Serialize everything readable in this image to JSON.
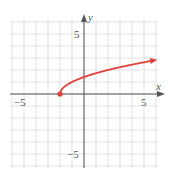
{
  "chart_data": {
    "type": "line",
    "title": "",
    "function": "y = sqrt(x + 2)",
    "xlabel": "x",
    "ylabel": "y",
    "xlim": [
      -6,
      6
    ],
    "ylim": [
      -6,
      6
    ],
    "grid": true,
    "tick_labels": {
      "x": [
        {
          "value": -5,
          "label": "−5"
        },
        {
          "value": 5,
          "label": "5"
        }
      ],
      "y": [
        {
          "value": 5,
          "label": "5"
        },
        {
          "value": -5,
          "label": "−5"
        }
      ]
    },
    "series": [
      {
        "name": "curve",
        "color": "#e0403c",
        "start_point": {
          "x": -2,
          "y": 0,
          "closed": true
        },
        "end_arrow": true,
        "x": [
          -2,
          -1.75,
          -1.5,
          -1,
          -0.5,
          0,
          1,
          2,
          3,
          4,
          5,
          6
        ],
        "y": [
          0,
          0.5,
          0.71,
          1,
          1.22,
          1.41,
          1.73,
          2,
          2.24,
          2.45,
          2.65,
          2.83
        ]
      }
    ]
  },
  "axes": {
    "x_label": "x",
    "y_label": "y",
    "x_tick_neg": "−5",
    "x_tick_pos": "5",
    "y_tick_pos": "5",
    "y_tick_neg": "−5"
  },
  "colors": {
    "grid": "#dcdcdc",
    "axis": "#555555",
    "curve": "#e0403c"
  }
}
